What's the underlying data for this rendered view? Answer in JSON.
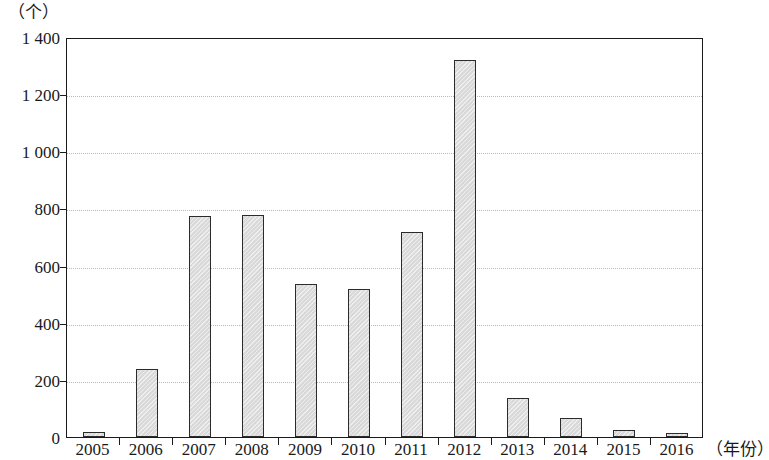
{
  "chart_data": {
    "type": "bar",
    "title": "",
    "unit_label": "（个）",
    "xlabel": "（年份）",
    "ylabel": "",
    "categories": [
      "2005",
      "2006",
      "2007",
      "2008",
      "2009",
      "2010",
      "2011",
      "2012",
      "2013",
      "2014",
      "2015",
      "2016"
    ],
    "values": [
      18,
      238,
      775,
      778,
      535,
      518,
      718,
      1320,
      135,
      68,
      25,
      15
    ],
    "ylim": [
      0,
      1400
    ],
    "y_ticks": [
      0,
      200,
      400,
      600,
      800,
      1000,
      1200,
      1400
    ],
    "y_tick_labels": [
      "0",
      "200",
      "400",
      "600",
      "800",
      "1 000",
      "1 200",
      "1 400"
    ],
    "grid": true,
    "grid_axis": "y",
    "legend": "none",
    "bar_fill_color": "#d9d9d9",
    "bar_border_color": "#2b2b2b",
    "axis_color": "#1a1a1a",
    "gridline_color": "#b9b9b9"
  }
}
